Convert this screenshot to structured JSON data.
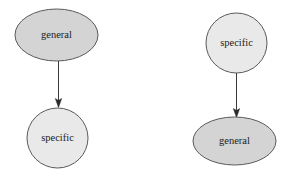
{
  "figure": {
    "title": "",
    "background_color": "#ffffff",
    "ellipse_fill": "#d4d4d4",
    "circle_fill": "#e9e9e9",
    "node_stroke": "#5a5a5a",
    "edge_color": "#2b2b2b",
    "label_color": "#1c1c1c"
  },
  "diagrams": [
    {
      "name": "general-to-specific",
      "source": {
        "label": "general",
        "shape": "ellipse",
        "fill": "#d4d4d4",
        "cx": 56.5,
        "cy": 35,
        "rx": 41.5,
        "ry": 26
      },
      "target": {
        "label": "specific",
        "shape": "circle",
        "fill": "#e9e9e9",
        "cx": 57.5,
        "cy": 138,
        "rx": 30.5,
        "ry": 30
      },
      "edge": {
        "label": "",
        "direction": "down",
        "x": 58.5,
        "y_start": 61,
        "y_end": 107
      }
    },
    {
      "name": "specific-to-general",
      "source": {
        "label": "specific",
        "shape": "circle",
        "fill": "#e9e9e9",
        "cx": 236.5,
        "cy": 43,
        "rx": 30.5,
        "ry": 30
      },
      "target": {
        "label": "general",
        "shape": "ellipse",
        "fill": "#d4d4d4",
        "cx": 234.5,
        "cy": 141,
        "rx": 41.5,
        "ry": 24
      },
      "edge": {
        "label": "",
        "direction": "down",
        "x": 236.5,
        "y_start": 73,
        "y_end": 117
      }
    }
  ]
}
